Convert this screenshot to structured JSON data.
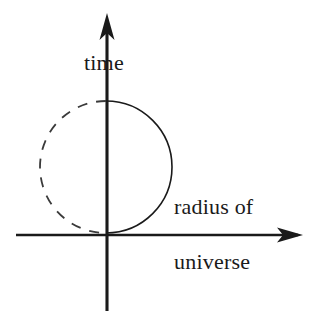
{
  "diagram": {
    "background_color": "#ffffff",
    "stroke_color": "#1a1a1a",
    "labels": {
      "y_axis": "time",
      "x_axis_line1": "radius of",
      "x_axis_line2": "universe"
    },
    "axes": {
      "vertical": {
        "name": "time-axis",
        "x": 107,
        "top_y": 13,
        "bottom_y": 311,
        "arrow": "up",
        "arrow_tip_y": 13
      },
      "horizontal": {
        "name": "radius-axis",
        "y": 235,
        "left_x": 16,
        "right_x": 303,
        "arrow": "right",
        "arrow_tip_x": 303
      },
      "origin": {
        "x": 107,
        "y": 235
      }
    },
    "circle": {
      "name": "universe-worldline-circle",
      "center_x": 106,
      "center_y": 167,
      "radius": 66,
      "right_half_style": "solid",
      "left_half_style": "dashed",
      "dash_pattern": "10 9",
      "tangent_to_x_axis": true
    }
  }
}
